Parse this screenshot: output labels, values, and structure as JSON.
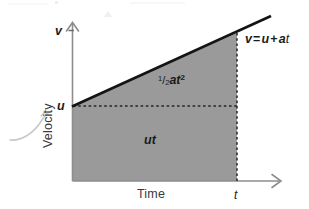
{
  "figure": {
    "kind": "velocity-time-graph",
    "background_color": "#ffffff",
    "line_color": "#1b1b1b",
    "fill_color": "#9a9a9a",
    "axis_color": "#8a8a8a",
    "dash_color": "#2b2b2b"
  },
  "axes": {
    "y_axis_name": "Velocity",
    "x_axis_name": "Time",
    "y_tick_label": "v",
    "y_intercept_label": "u",
    "x_tick_label": "t"
  },
  "annotations": {
    "equation": {
      "v": "v",
      "equals": "=",
      "u": "u",
      "plus": "+",
      "a": "a",
      "t": "t",
      "full": "v = u + at"
    },
    "upper_area": {
      "fraction_numerator": "1",
      "fraction_slash": "/",
      "fraction_denominator": "2",
      "variables": "at",
      "exponent": "2",
      "full": "1/2at2"
    },
    "lower_area": {
      "label": "ut"
    }
  },
  "chart_data": {
    "type": "area",
    "title": "",
    "xlabel": "Time",
    "ylabel": "Velocity",
    "series": [
      {
        "name": "v = u + at",
        "x": [
          0,
          1
        ],
        "y": [
          "u",
          "v"
        ],
        "description": "Straight line of constant positive slope a, starting at initial velocity u at time 0 and reaching final velocity v at time t"
      }
    ],
    "shaded_regions": [
      {
        "name": "ut",
        "shape": "rectangle",
        "label": "ut",
        "meaning": "displacement from initial velocity"
      },
      {
        "name": "half-a-t-squared",
        "shape": "triangle",
        "label": "1/2at2",
        "meaning": "extra displacement due to acceleration"
      }
    ],
    "axis_ticks": {
      "y": [
        "u",
        "v"
      ],
      "x": [
        "t"
      ]
    },
    "grid": false,
    "legend": "none"
  }
}
